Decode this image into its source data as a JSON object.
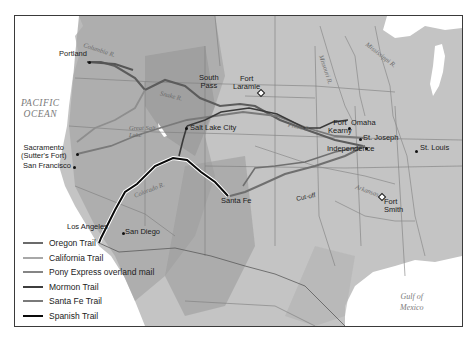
{
  "map": {
    "bodies_of_water": {
      "pacific": "PACIFIC\nOCEAN",
      "pacific_line1": "PACIFIC",
      "pacific_line2": "OCEAN",
      "gulf_line1": "Gulf of",
      "gulf_line2": "Mexico"
    },
    "rivers": {
      "columbia": "Columbia R.",
      "snake": "Snake R.",
      "missouri": "Missouri R.",
      "mississippi": "Mississippi R.",
      "platte": "Platte R.",
      "great_salt_lake": "Great Salt Lake",
      "colorado": "Colorado R.",
      "arkansas": "Arkansas R."
    },
    "places": {
      "portland": "Portland",
      "south_pass_1": "South",
      "south_pass_2": "Pass",
      "fort_laramie_1": "Fort",
      "fort_laramie_2": "Laramie",
      "fort_kearny_1": "Fort",
      "fort_kearny_2": "Kearny",
      "omaha": "Omaha",
      "st_joseph": "St. Joseph",
      "independence": "Independence",
      "st_louis": "St. Louis",
      "salt_lake_city": "Salt Lake City",
      "sacramento_1": "Sacramento",
      "sacramento_2": "(Sutter's Fort)",
      "san_francisco": "San Francisco",
      "los_angeles": "Los Angeles",
      "san_diego": "San Diego",
      "santa_fe": "Santa Fe",
      "cutoff": "Cut-off",
      "fort_smith_1": "Fort",
      "fort_smith_2": "Smith"
    }
  },
  "legend": {
    "items": [
      {
        "label": "Oregon Trail",
        "color": "#6b6b6b"
      },
      {
        "label": "California Trail",
        "color": "#a8a8a8"
      },
      {
        "label": "Pony Express overland mail",
        "color": "#858585"
      },
      {
        "label": "Mormon Trail",
        "color": "#3d3d3d"
      },
      {
        "label": "Santa Fe Trail",
        "color": "#7a7a7a"
      },
      {
        "label": "Spanish Trail",
        "color": "#0a0a0a"
      }
    ]
  }
}
